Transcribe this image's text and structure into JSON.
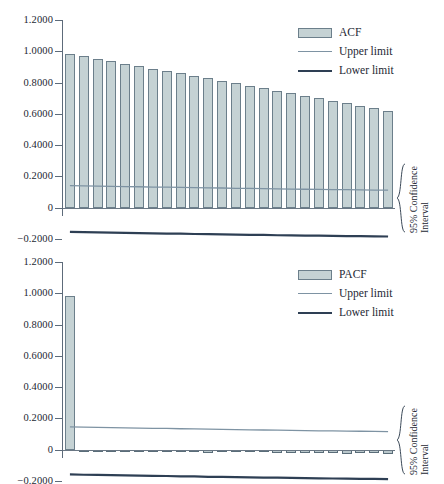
{
  "figure": {
    "background": "#ffffff",
    "bar_fill": "#c5d2d4",
    "bar_stroke": "#6c7f8b",
    "upper_limit_color": "#7e93a3",
    "lower_limit_color": "#2e3f54",
    "axis_color": "#5d6b7a"
  },
  "panels": [
    {
      "id": "acf",
      "legend": {
        "series_label": "ACF",
        "upper_label": "Upper limit",
        "lower_label": "Lower limit"
      },
      "ci_caption": {
        "line1": "95% Confidence",
        "line2": "Interval"
      }
    },
    {
      "id": "pacf",
      "legend": {
        "series_label": "PACF",
        "upper_label": "Upper limit",
        "lower_label": "Lower limit"
      },
      "ci_caption": {
        "line1": "95% Confidence",
        "line2": "Interval"
      }
    }
  ],
  "chart_data": [
    {
      "type": "bar",
      "id": "acf-correlogram",
      "title": "",
      "xlabel": "",
      "ylabel": "",
      "ylim": [
        -0.2,
        1.2
      ],
      "yticks": [
        1.2,
        1.0,
        0.8,
        0.6,
        0.4,
        0.2,
        0,
        -0.2
      ],
      "ytick_labels": [
        "1.2000",
        "1.0000",
        "0.8000",
        "0.6000",
        "0.4000",
        "0.2000",
        "0",
        "-0.2000"
      ],
      "grid": false,
      "legend_position": "top-right",
      "categories": [
        1,
        2,
        3,
        4,
        5,
        6,
        7,
        8,
        9,
        10,
        11,
        12,
        13,
        14,
        15,
        16,
        17,
        18,
        19,
        20,
        21,
        22,
        23,
        24
      ],
      "series": [
        {
          "name": "ACF",
          "values": [
            0.983,
            0.967,
            0.952,
            0.936,
            0.921,
            0.905,
            0.889,
            0.872,
            0.858,
            0.843,
            0.827,
            0.812,
            0.797,
            0.78,
            0.764,
            0.748,
            0.733,
            0.717,
            0.7,
            0.683,
            0.667,
            0.651,
            0.635,
            0.62
          ]
        },
        {
          "name": "Upper limit",
          "values": [
            0.141,
            0.14,
            0.138,
            0.137,
            0.135,
            0.134,
            0.132,
            0.131,
            0.13,
            0.128,
            0.127,
            0.126,
            0.124,
            0.123,
            0.122,
            0.12,
            0.119,
            0.118,
            0.117,
            0.116,
            0.115,
            0.114,
            0.113,
            0.112
          ]
        },
        {
          "name": "Lower limit",
          "values": [
            -0.155,
            -0.156,
            -0.158,
            -0.159,
            -0.161,
            -0.162,
            -0.164,
            -0.165,
            -0.166,
            -0.168,
            -0.169,
            -0.17,
            -0.172,
            -0.173,
            -0.174,
            -0.176,
            -0.177,
            -0.178,
            -0.179,
            -0.18,
            -0.181,
            -0.182,
            -0.183,
            -0.184
          ]
        }
      ],
      "annotations": [
        "95% Confidence Interval"
      ]
    },
    {
      "type": "bar",
      "id": "pacf-correlogram",
      "title": "",
      "xlabel": "",
      "ylabel": "",
      "ylim": [
        -0.2,
        1.2
      ],
      "yticks": [
        1.2,
        1.0,
        0.8,
        0.6,
        0.4,
        0.2,
        0,
        -0.2
      ],
      "ytick_labels": [
        "1.2000",
        "1.0000",
        "0.8000",
        "0.6000",
        "0.4000",
        "0.2000",
        "0",
        "-0.2000"
      ],
      "grid": false,
      "legend_position": "top-right",
      "categories": [
        1,
        2,
        3,
        4,
        5,
        6,
        7,
        8,
        9,
        10,
        11,
        12,
        13,
        14,
        15,
        16,
        17,
        18,
        19,
        20,
        21,
        22,
        23,
        24
      ],
      "series": [
        {
          "name": "PACF",
          "values": [
            0.983,
            -0.012,
            -0.01,
            -0.011,
            -0.014,
            -0.012,
            -0.013,
            -0.016,
            -0.014,
            -0.013,
            -0.018,
            -0.015,
            -0.014,
            -0.017,
            -0.016,
            -0.02,
            -0.024,
            -0.022,
            -0.021,
            -0.02,
            -0.025,
            -0.024,
            -0.023,
            -0.026
          ]
        },
        {
          "name": "Upper limit",
          "values": [
            0.146,
            0.144,
            0.143,
            0.141,
            0.14,
            0.138,
            0.137,
            0.136,
            0.134,
            0.133,
            0.131,
            0.13,
            0.129,
            0.127,
            0.126,
            0.125,
            0.124,
            0.122,
            0.121,
            0.12,
            0.119,
            0.118,
            0.117,
            0.116
          ]
        },
        {
          "name": "Lower limit",
          "values": [
            -0.158,
            -0.16,
            -0.161,
            -0.163,
            -0.164,
            -0.166,
            -0.167,
            -0.168,
            -0.17,
            -0.171,
            -0.173,
            -0.174,
            -0.175,
            -0.177,
            -0.178,
            -0.179,
            -0.18,
            -0.182,
            -0.183,
            -0.184,
            -0.185,
            -0.186,
            -0.187,
            -0.188
          ]
        }
      ],
      "annotations": [
        "95% Confidence Interval"
      ]
    }
  ]
}
